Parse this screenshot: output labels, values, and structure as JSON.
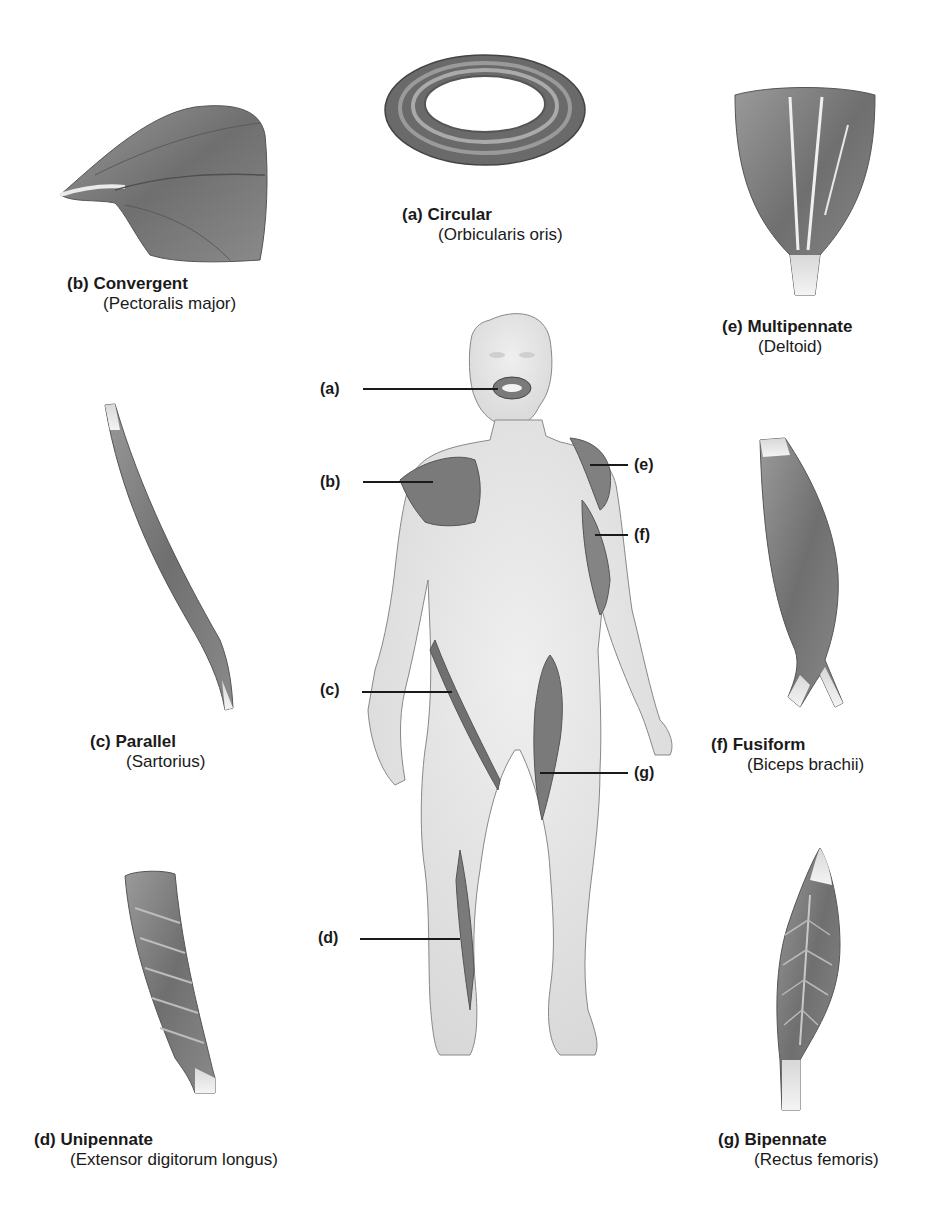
{
  "figure": {
    "patterns": [
      {
        "letter": "(a)",
        "type": "Circular",
        "example": "(Orbicularis oris)"
      },
      {
        "letter": "(b)",
        "type": "Convergent",
        "example": "(Pectoralis major)"
      },
      {
        "letter": "(c)",
        "type": "Parallel",
        "example": "(Sartorius)"
      },
      {
        "letter": "(d)",
        "type": "Unipennate",
        "example": "(Extensor digitorum longus)"
      },
      {
        "letter": "(e)",
        "type": "Multipennate",
        "example": "(Deltoid)"
      },
      {
        "letter": "(f)",
        "type": "Fusiform",
        "example": "(Biceps brachii)"
      },
      {
        "letter": "(g)",
        "type": "Bipennate",
        "example": "(Rectus femoris)"
      }
    ],
    "callouts": [
      "(a)",
      "(b)",
      "(c)",
      "(d)",
      "(e)",
      "(f)",
      "(g)"
    ],
    "colors": {
      "muscle": "#7a7a7a",
      "muscle_dark": "#5a5a5a",
      "skin": "#e4e4e4",
      "text": "#1a1a1a"
    }
  }
}
